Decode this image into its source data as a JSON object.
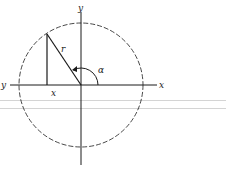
{
  "diagram": {
    "type": "unit-circle-polar-angle",
    "labels": {
      "y_top": "y",
      "x_right": "x",
      "y_left": "y",
      "x_foot": "x",
      "radius": "r",
      "angle": "α"
    },
    "colors": {
      "ink": "#1a1a1a",
      "rule": "#d4d4d4"
    }
  }
}
